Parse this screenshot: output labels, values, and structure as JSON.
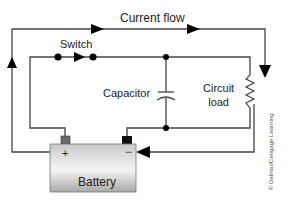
{
  "diagram": {
    "type": "circuit",
    "labels": {
      "current_flow": "Current flow",
      "switch": "Switch",
      "capacitor": "Capacitor",
      "circuit_load_line1": "Circuit",
      "circuit_load_line2": "load",
      "battery": "Battery",
      "positive_terminal": "+",
      "negative_terminal": "−"
    },
    "credit": "© Delmar/Cengage Learning",
    "colors": {
      "wire": "#444444",
      "arrow": "#000000",
      "battery_top": "#d8d8d8",
      "battery_bottom": "#b0b0b0",
      "positive_post": "#6b6b6b",
      "negative_post": "#111111"
    },
    "components": [
      "battery",
      "switch",
      "capacitor",
      "circuit-load-resistor"
    ],
    "flow_arrows": [
      "up-left-side",
      "right-top",
      "down-right-side",
      "left-bottom-into-battery"
    ]
  }
}
